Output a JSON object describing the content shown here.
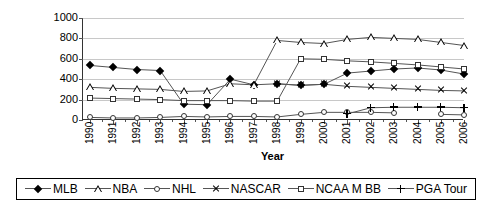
{
  "chart_data": {
    "type": "line",
    "title": "",
    "xlabel": "Year",
    "ylabel": "2005 $(Millions)",
    "ylim": [
      0,
      1000
    ],
    "ytick_labels": [
      "1000",
      "800",
      "600",
      "400",
      "200",
      "0"
    ],
    "ytick_values": [
      1000,
      800,
      600,
      400,
      200,
      0
    ],
    "grid": true,
    "legend_position": "bottom",
    "categories": [
      "1990",
      "1991",
      "1992",
      "1993",
      "1994",
      "1995",
      "1996",
      "1997",
      "1998",
      "1999",
      "2000",
      "2001",
      "2002",
      "2003",
      "2004",
      "2005",
      "2006"
    ],
    "series": [
      {
        "name": "MLB",
        "marker": "filled-diamond",
        "values": [
          535,
          515,
          495,
          485,
          155,
          150,
          400,
          345,
          355,
          340,
          350,
          460,
          480,
          500,
          510,
          490,
          450
        ]
      },
      {
        "name": "NBA",
        "marker": "open-triangle",
        "values": [
          320,
          310,
          305,
          300,
          280,
          285,
          355,
          345,
          780,
          760,
          750,
          790,
          810,
          800,
          790,
          760,
          730
        ]
      },
      {
        "name": "NHL",
        "marker": "open-circle",
        "values": [
          25,
          20,
          20,
          25,
          35,
          30,
          35,
          35,
          30,
          55,
          75,
          75,
          75,
          70,
          null,
          55,
          50
        ]
      },
      {
        "name": "NASCAR",
        "marker": "x-cross",
        "values": [
          null,
          null,
          null,
          null,
          null,
          null,
          null,
          null,
          355,
          340,
          350,
          330,
          320,
          310,
          300,
          290,
          285
        ]
      },
      {
        "name": "NCAA M BB",
        "marker": "open-square",
        "values": [
          215,
          210,
          205,
          200,
          190,
          190,
          190,
          185,
          185,
          600,
          595,
          580,
          570,
          555,
          540,
          520,
          500
        ]
      },
      {
        "name": "PGA Tour",
        "marker": "plus-line",
        "values": [
          null,
          null,
          null,
          null,
          null,
          null,
          null,
          null,
          null,
          null,
          null,
          60,
          120,
          125,
          125,
          125,
          120
        ]
      }
    ]
  },
  "legend": {
    "entries": [
      {
        "label": "MLB",
        "marker": "filled-diamond"
      },
      {
        "label": "NBA",
        "marker": "open-triangle"
      },
      {
        "label": "NHL",
        "marker": "open-circle"
      },
      {
        "label": "NASCAR",
        "marker": "x-cross"
      },
      {
        "label": "NCAA M BB",
        "marker": "open-square"
      },
      {
        "label": "PGA Tour",
        "marker": "plus-line"
      }
    ]
  },
  "colors": {
    "series_line": "#555555",
    "gridline": "#c8c8c8",
    "axis": "#333333",
    "marker": "#000000",
    "background": "#ffffff"
  }
}
